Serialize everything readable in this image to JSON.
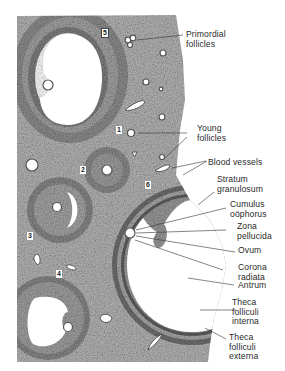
{
  "figure": {
    "follicle_numbers": [
      "1",
      "2",
      "3",
      "4",
      "5",
      "6"
    ],
    "labels": [
      {
        "id": "primordial-follicles",
        "text": "Primordial\nfollicles"
      },
      {
        "id": "young-follicles",
        "text": "Young\nfollicles"
      },
      {
        "id": "blood-vessels",
        "text": "Blood vessels"
      },
      {
        "id": "stratum-granulosum",
        "text": "Stratum\ngranulosum"
      },
      {
        "id": "cumulus-oophorus",
        "text": "Cumulus\noöphorus"
      },
      {
        "id": "zona-pellucida",
        "text": "Zona\npellucida"
      },
      {
        "id": "ovum",
        "text": "Ovum"
      },
      {
        "id": "corona-radiata",
        "text": "Corona\nradiata"
      },
      {
        "id": "antrum",
        "text": "Antrum"
      },
      {
        "id": "theca-folliculi-interna",
        "text": "Theca\nfolliculi\ninterna"
      },
      {
        "id": "theca-folliculi-externa",
        "text": "Theca\nfolliculi\nexterna"
      }
    ],
    "colors": {
      "tissue": "#a9a9a9",
      "tissue_dark": "#6e6e6e",
      "cavity": "#ffffff",
      "line": "#333333"
    }
  }
}
